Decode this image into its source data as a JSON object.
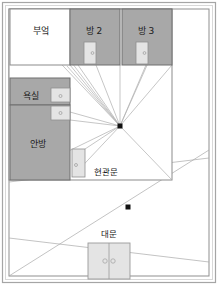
{
  "figure": {
    "type": "floor-plan-perspective-diagram",
    "background_color": "#ffffff",
    "outer_border_color": "#9a9a9a",
    "inner_border_color": "#8a8a8a",
    "room_fill_color": "#a8a8a8",
    "room_fill_color_light": "#ababab",
    "door_fill_color": "#e2e2e2",
    "door_stroke_color": "#8f8f8f",
    "line_color": "#9c9c9c",
    "wall_color": "#5a5a5a",
    "vanishing_point_color": "#111111"
  },
  "rooms": [
    {
      "id": "kitchen",
      "label": "부엌",
      "label_x": 41,
      "label_y": 31,
      "filled": false
    },
    {
      "id": "room2",
      "label": "방 2",
      "label_x": 94,
      "label_y": 31,
      "filled": true
    },
    {
      "id": "room3",
      "label": "방 3",
      "label_x": 146,
      "label_y": 31,
      "filled": true
    },
    {
      "id": "bathroom",
      "label": "욕실",
      "label_x": 33,
      "label_y": 97,
      "filled": true
    },
    {
      "id": "master-room",
      "label": "안방",
      "label_x": 40,
      "label_y": 144,
      "filled": true
    }
  ],
  "doors": [
    {
      "id": "room2-door",
      "x": 84,
      "y": 42,
      "w": 12,
      "h": 22,
      "knob": "right"
    },
    {
      "id": "room3-door",
      "x": 136,
      "y": 42,
      "w": 12,
      "h": 22,
      "knob": "right"
    },
    {
      "id": "bathroom-door",
      "x": 51,
      "y": 89,
      "w": 19,
      "h": 13,
      "knob": "center"
    },
    {
      "id": "master-door",
      "x": 51,
      "y": 106,
      "w": 19,
      "h": 13,
      "knob": "center"
    },
    {
      "id": "entrance-door",
      "x": 72,
      "y": 149,
      "w": 13,
      "h": 28,
      "knob": "left"
    }
  ],
  "labels": [
    {
      "id": "entrance-label",
      "label": "현관문",
      "x": 105,
      "y": 171
    },
    {
      "id": "gate-label",
      "label": "대문",
      "x": 110,
      "y": 234
    }
  ],
  "gate": {
    "id": "main-gate",
    "x": 88,
    "y": 243,
    "w": 42,
    "h": 36,
    "leaves": 2,
    "knobs": 2
  },
  "vanishing_points": [
    {
      "id": "vp-interior",
      "x": 120,
      "y": 126
    },
    {
      "id": "vp-yard",
      "x": 128,
      "y": 207
    }
  ],
  "geometry": {
    "outer_frame": {
      "x": 2,
      "y": 2,
      "w": 214,
      "h": 281
    },
    "inner_frame": {
      "x": 8,
      "y": 8,
      "w": 202,
      "h": 269
    },
    "house_rect": {
      "x": 9,
      "y": 9,
      "w": 163,
      "h": 171
    },
    "top_rooms_y": 65,
    "kitchen_right": 70,
    "room2_right": 120,
    "left_rooms_x": 10,
    "left_rooms_right": 70,
    "bathroom_top": 78,
    "bathroom_bottom": 105,
    "master_bottom": 180
  }
}
